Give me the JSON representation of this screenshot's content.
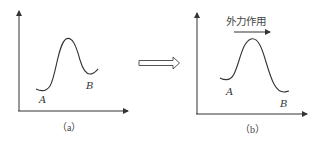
{
  "figure": {
    "panel_a": {
      "caption": "（a）",
      "point_a": "A",
      "point_b": "B"
    },
    "transition_arrow": "hollow-right-arrow",
    "panel_b": {
      "caption": "（b）",
      "force_label": "外力作用",
      "point_a": "A",
      "point_b": "B"
    },
    "colors": {
      "line": "#333333",
      "text": "#444444"
    }
  }
}
